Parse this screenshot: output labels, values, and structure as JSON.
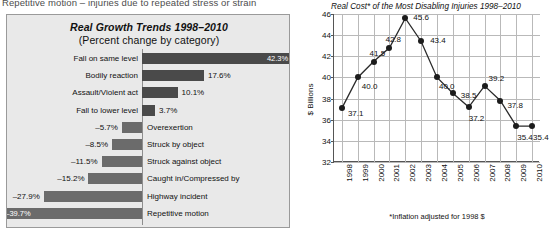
{
  "top_caption": "Repetitive motion – injuries due to repeated stress or strain",
  "bar_chart": {
    "title": "Real Growth Trends 1998–2010",
    "subtitle": "(Percent change by category)"
  },
  "line_chart": {
    "title": "Real Cost* of the Most Disabling Injuries 1998–2010",
    "ylabel": "$ Billions",
    "footnote": "*Inflation adjusted for 1998 $"
  },
  "chart_data": [
    {
      "type": "bar",
      "title": "Real Growth Trends 1998–2010",
      "subtitle": "(Percent change by category)",
      "xlabel": "",
      "ylabel": "",
      "orientation": "horizontal",
      "grid": false,
      "legend": "none",
      "xlim": [
        -42,
        45
      ],
      "categories": [
        "Fall on same level",
        "Bodily reaction",
        "Assault/Violent act",
        "Fall to lower level",
        "Overexertion",
        "Struck by object",
        "Struck against object",
        "Caught in/Compressed by",
        "Highway incident",
        "Repetitive motion"
      ],
      "values": [
        42.3,
        17.6,
        10.1,
        3.7,
        -5.7,
        -8.5,
        -11.5,
        -15.2,
        -27.9,
        -39.7
      ],
      "value_labels": [
        "42.3%",
        "17.6%",
        "10.1%",
        "3.7%",
        "–5.7%",
        "–8.5%",
        "–11.5%",
        "–15.2%",
        "–27.9%",
        "–39.7%"
      ]
    },
    {
      "type": "line",
      "title": "Real Cost* of the Most Disabling Injuries 1998–2010",
      "xlabel": "",
      "ylabel": "$ Billions",
      "ylim": [
        32,
        46
      ],
      "ytick_step": 2,
      "yticks": [
        32,
        34,
        36,
        38,
        40,
        42,
        44,
        46
      ],
      "grid": true,
      "legend": "none",
      "annotation": "*Inflation adjusted for 1998 $",
      "x": [
        "1998",
        "1999",
        "2000",
        "2001",
        "2002",
        "2003",
        "2004",
        "2005",
        "2006",
        "2007",
        "2008",
        "2009",
        "2010"
      ],
      "values": [
        37.1,
        40.0,
        41.5,
        42.8,
        45.6,
        43.4,
        40.0,
        38.5,
        37.2,
        39.2,
        37.8,
        35.4,
        35.4
      ],
      "point_labels": [
        "37.1",
        "40.0",
        "41.5",
        "42.8",
        "45.6",
        "43.4",
        "40.0",
        "38.5",
        "37.2",
        "39.2",
        "37.8",
        "35.4",
        "35.4"
      ]
    }
  ]
}
